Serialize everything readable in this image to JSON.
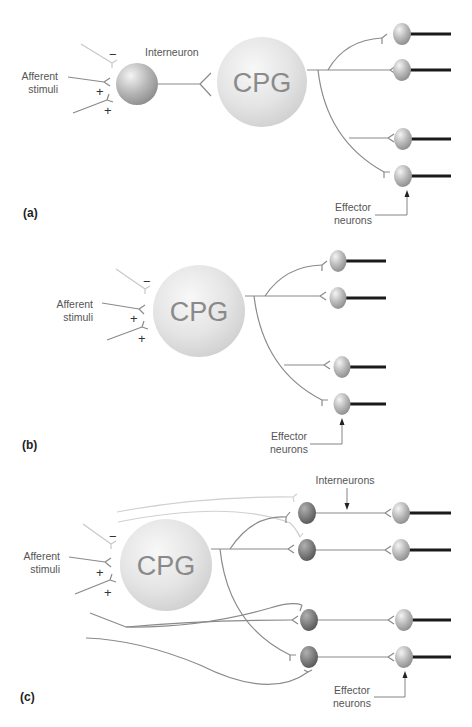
{
  "figure": {
    "panels": [
      {
        "id": "a",
        "label": "(a)",
        "cpg_label": "CPG",
        "interneuron_label": "Interneuron",
        "afferent_label_line1": "Afferent",
        "afferent_label_line2": "stimuli",
        "signs": [
          "−",
          "+",
          "+"
        ],
        "effector_label_line1": "Effector",
        "effector_label_line2": "neurons",
        "effector_count": 4
      },
      {
        "id": "b",
        "label": "(b)",
        "cpg_label": "CPG",
        "afferent_label_line1": "Afferent",
        "afferent_label_line2": "stimuli",
        "signs": [
          "−",
          "+",
          "+"
        ],
        "effector_label_line1": "Effector",
        "effector_label_line2": "neurons",
        "effector_count": 4
      },
      {
        "id": "c",
        "label": "(c)",
        "cpg_label": "CPG",
        "interneurons_label": "Interneurons",
        "afferent_label_line1": "Afferent",
        "afferent_label_line2": "stimuli",
        "signs": [
          "−",
          "+",
          "+"
        ],
        "effector_label_line1": "Effector",
        "effector_label_line2": "neurons",
        "interneuron_count": 4,
        "effector_count": 4
      }
    ]
  },
  "colors": {
    "axon": "#8a8a8a",
    "inhibitory_axon": "#c8c8c8",
    "effector_axon": "#1a1a1a",
    "cpg_sphere": "#e2e2e2",
    "effector_sphere": "#bdbdbd",
    "interneuron_sphere_c": "#7a7a7a"
  }
}
